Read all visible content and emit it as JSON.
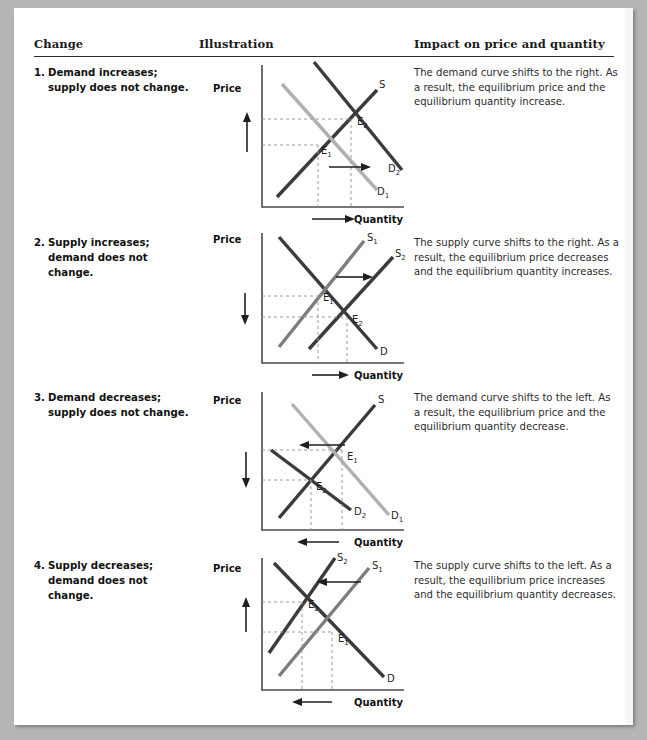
{
  "page": {
    "background_color": "#b5b5b5",
    "paper_color": "#ffffff"
  },
  "table": {
    "headers": {
      "change": "Change",
      "illustration": "Illustration",
      "impact": "Impact on price and quantity"
    },
    "rows": [
      {
        "number": "1.",
        "change": "Demand increases; supply does not change.",
        "impact": "The demand curve shifts to the right. As a result, the equilibrium price and the equilibrium quantity increase.",
        "chart": {
          "axis_y_label": "Price",
          "axis_x_label": "Quantity",
          "curve_labels": [
            "S",
            "D",
            "D",
            "E",
            "E"
          ],
          "labels": {
            "supply": "S",
            "demand_old": "D",
            "demand_old_sub": "1",
            "demand_new": "D",
            "demand_new_sub": "2",
            "eq_old": "E",
            "eq_old_sub": "1",
            "eq_new": "E",
            "eq_new_sub": "2"
          },
          "price_arrow_direction": "up",
          "quantity_arrow_direction": "right",
          "shift_arrow_direction": "right"
        }
      },
      {
        "number": "2.",
        "change": "Supply increases; demand does not change.",
        "impact": "The supply curve shifts to the right. As a result, the equilibrium price decreases and the equilibrium quantity increases.",
        "chart": {
          "axis_y_label": "Price",
          "axis_x_label": "Quantity",
          "labels": {
            "supply_old": "S",
            "supply_old_sub": "1",
            "supply_new": "S",
            "supply_new_sub": "2",
            "demand": "D",
            "eq_old": "E",
            "eq_old_sub": "1",
            "eq_new": "E",
            "eq_new_sub": "2"
          },
          "price_arrow_direction": "down",
          "quantity_arrow_direction": "right",
          "shift_arrow_direction": "right"
        }
      },
      {
        "number": "3.",
        "change": "Demand decreases; supply does not change.",
        "impact": "The demand curve shifts to the left. As a result, the equilibrium price and the equilibrium quantity decrease.",
        "chart": {
          "axis_y_label": "Price",
          "axis_x_label": "Quantity",
          "labels": {
            "supply": "S",
            "demand_old": "D",
            "demand_old_sub": "1",
            "demand_new": "D",
            "demand_new_sub": "2",
            "eq_old": "E",
            "eq_old_sub": "1",
            "eq_new": "E",
            "eq_new_sub": "2"
          },
          "price_arrow_direction": "down",
          "quantity_arrow_direction": "left",
          "shift_arrow_direction": "left"
        }
      },
      {
        "number": "4.",
        "change": "Supply decreases; demand does not change.",
        "impact": "The supply curve shifts to the left. As a result, the equilibrium price increases and the equilibrium quantity decreases.",
        "chart": {
          "axis_y_label": "Price",
          "axis_x_label": "Quantity",
          "labels": {
            "supply_old": "S",
            "supply_old_sub": "1",
            "supply_new": "S",
            "supply_new_sub": "2",
            "demand": "D",
            "eq_old": "E",
            "eq_old_sub": "1",
            "eq_new": "E",
            "eq_new_sub": "2"
          },
          "price_arrow_direction": "up",
          "quantity_arrow_direction": "left",
          "shift_arrow_direction": "left"
        }
      }
    ]
  },
  "colors": {
    "curve_dark": "#3b3b3b",
    "curve_light": "#b0b0b0",
    "axis": "#4a4a4a",
    "dashed": "#9a9a9a",
    "text": "#1a1a1a"
  }
}
